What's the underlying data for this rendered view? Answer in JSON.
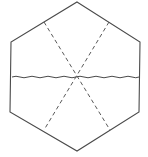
{
  "diagram": {
    "shape": "hexagon",
    "stroke_color": "#4a4a4a",
    "dash_color": "#5a5a5a",
    "vertices": [
      [
        77,
        2
      ],
      [
        140,
        42
      ],
      [
        139,
        112
      ],
      [
        77,
        151
      ],
      [
        10,
        112
      ],
      [
        11,
        42
      ]
    ],
    "center": [
      76,
      77
    ],
    "lines": [
      {
        "type": "wavy",
        "from": [
          12,
          77
        ],
        "to": [
          139,
          77
        ]
      },
      {
        "type": "dashed",
        "from": [
          44,
          22
        ],
        "to": [
          110,
          130
        ]
      },
      {
        "type": "dashed",
        "from": [
          109,
          22
        ],
        "to": [
          44,
          130
        ]
      }
    ]
  }
}
